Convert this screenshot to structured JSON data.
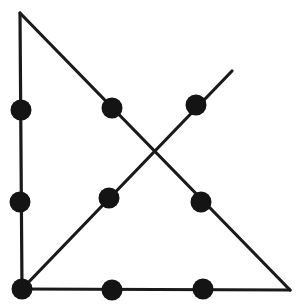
{
  "figure": {
    "width": 302,
    "height": 307,
    "background_color": "#ffffff",
    "stroke_color": "#1a1a1a",
    "stroke_width": 3.2,
    "dot_color": "#141414",
    "dot_radius": 10.5,
    "node_count": 9,
    "stroke_count": 4
  },
  "strokes": [
    {
      "name": "left-vertical-edge",
      "label": "Left vertical side",
      "x1": 20,
      "y1": 13,
      "x2": 22,
      "y2": 289
    },
    {
      "name": "hypotenuse-edge",
      "label": "Descending hypotenuse",
      "x1": 20,
      "y1": 13,
      "x2": 290,
      "y2": 290
    },
    {
      "name": "bottom-horizontal-edge",
      "label": "Bottom horizontal side",
      "x1": 22,
      "y1": 289,
      "x2": 290,
      "y2": 290
    },
    {
      "name": "rising-diagonal-stroke",
      "label": "Rising diagonal stroke",
      "x1": 22,
      "y1": 289,
      "x2": 232,
      "y2": 71
    }
  ],
  "nodes": [
    {
      "name": "node-left-upper",
      "label": "Left edge upper dot",
      "cx": 21,
      "cy": 110
    },
    {
      "name": "node-left-lower",
      "label": "Left edge lower dot",
      "cx": 20,
      "cy": 202
    },
    {
      "name": "node-hypotenuse-upper",
      "label": "Hypotenuse upper dot",
      "cx": 112,
      "cy": 108
    },
    {
      "name": "node-hypotenuse-lower",
      "label": "Hypotenuse lower dot",
      "cx": 201,
      "cy": 202
    },
    {
      "name": "node-diagonal-upper",
      "label": "Rising diagonal upper dot",
      "cx": 196,
      "cy": 105
    },
    {
      "name": "node-diagonal-lower",
      "label": "Rising diagonal lower dot",
      "cx": 109,
      "cy": 198
    },
    {
      "name": "node-bottom-left-corner",
      "label": "Bottom-left corner dot",
      "cx": 22,
      "cy": 289
    },
    {
      "name": "node-bottom-middle",
      "label": "Bottom edge middle dot",
      "cx": 112,
      "cy": 290
    },
    {
      "name": "node-bottom-right-inner",
      "label": "Bottom edge right dot",
      "cx": 203,
      "cy": 289
    }
  ],
  "vertices": [
    {
      "name": "vertex-apex",
      "label": "Top apex",
      "x": 20,
      "y": 13
    },
    {
      "name": "vertex-bottom-left",
      "label": "Bottom-left vertex",
      "x": 22,
      "y": 289
    },
    {
      "name": "vertex-bottom-right",
      "label": "Bottom-right vertex",
      "x": 290,
      "y": 290
    },
    {
      "name": "vertex-diagonal-tip",
      "label": "Diagonal tip",
      "x": 232,
      "y": 71
    }
  ],
  "intersection": {
    "name": "diagonal-crossing-point",
    "label": "Crossing point of the two diagonals",
    "x": 153,
    "y": 153
  }
}
